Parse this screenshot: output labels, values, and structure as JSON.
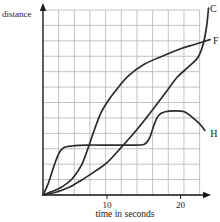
{
  "figure": {
    "ylabel": "distance",
    "xlabel": "time in seconds",
    "xtick_labels": [
      "10",
      "20"
    ],
    "curve_labels": [
      "C",
      "F",
      "H"
    ]
  },
  "colors": {
    "background": "#ffffff",
    "grid": "#b4b4b4",
    "axis": "#1a1a1a",
    "curve": "#2b2b2b",
    "text": "#1a1a1a"
  },
  "chart_data": {
    "type": "line",
    "title": "",
    "xlabel": "time in seconds",
    "ylabel": "distance",
    "x_ticks": [
      10,
      20
    ],
    "y_ticks": [],
    "xlim": [
      0,
      24
    ],
    "ylim": [
      0,
      105
    ],
    "grid": true,
    "legend_position": "curve-end-labels",
    "series": [
      {
        "name": "C",
        "points": [
          [
            0,
            0
          ],
          [
            2,
            1.5
          ],
          [
            4,
            4
          ],
          [
            6,
            8
          ],
          [
            8,
            12.5
          ],
          [
            10,
            17.5
          ],
          [
            12,
            26
          ],
          [
            14,
            35
          ],
          [
            16,
            45
          ],
          [
            18,
            55.5
          ],
          [
            19.5,
            63.5
          ],
          [
            21,
            69
          ],
          [
            22.3,
            74
          ],
          [
            23,
            80.5
          ],
          [
            23.5,
            90
          ],
          [
            23.8,
            101
          ]
        ]
      },
      {
        "name": "F",
        "points": [
          [
            0,
            0
          ],
          [
            1.5,
            2
          ],
          [
            3,
            4.5
          ],
          [
            4.5,
            8.5
          ],
          [
            6,
            16
          ],
          [
            7,
            25
          ],
          [
            8,
            35
          ],
          [
            9,
            44
          ],
          [
            10,
            50
          ],
          [
            11,
            55.5
          ],
          [
            12.8,
            64
          ],
          [
            15,
            70.5
          ],
          [
            17.5,
            75
          ],
          [
            20,
            79
          ],
          [
            22,
            81.5
          ],
          [
            24,
            84
          ]
        ]
      },
      {
        "name": "H",
        "points": [
          [
            0,
            0
          ],
          [
            0.8,
            6
          ],
          [
            1.6,
            14.5
          ],
          [
            2.4,
            22
          ],
          [
            3.2,
            25.5
          ],
          [
            4.5,
            26.5
          ],
          [
            7,
            27
          ],
          [
            10,
            27
          ],
          [
            13,
            27
          ],
          [
            15,
            27.3
          ],
          [
            15.8,
            31
          ],
          [
            16.4,
            38
          ],
          [
            17,
            43
          ],
          [
            17.9,
            45
          ],
          [
            19.2,
            45.5
          ],
          [
            20.5,
            45
          ],
          [
            21.6,
            42
          ],
          [
            22.6,
            38.5
          ],
          [
            23.3,
            35
          ]
        ]
      }
    ]
  }
}
